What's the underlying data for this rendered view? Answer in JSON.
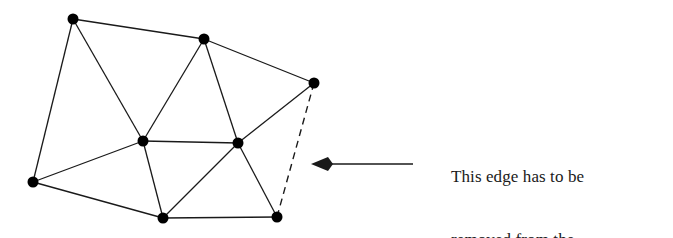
{
  "figure": {
    "background_color": "#ffffff",
    "stroke_color": "#1a1a1a",
    "vertex_color": "#000000",
    "vertex_radius": 5.5,
    "edge_width": 1.3,
    "dashed_edge_width": 1.4,
    "dash_pattern": "7 5"
  },
  "annotation": {
    "line1": "This edge has to be",
    "line2": "removed from the",
    "line3": "Delaunay triangulation."
  },
  "arrow": {
    "label": "pointer-to-dashed-edge",
    "direction": "left",
    "tail_x": 413,
    "tail_y": 164,
    "tip_x": 311,
    "tip_y": 164,
    "color": "#1a1a1a",
    "shaft_width": 1.6,
    "head_length": 17,
    "head_half_width": 7,
    "head_notch": 5
  },
  "graph": {
    "vertices": [
      {
        "id": "v0",
        "name": "top-left-vertex",
        "x": 73,
        "y": 19
      },
      {
        "id": "v1",
        "name": "top-middle-vertex",
        "x": 204,
        "y": 39
      },
      {
        "id": "v2",
        "name": "right-vertex",
        "x": 314,
        "y": 83
      },
      {
        "id": "v3",
        "name": "center-left-vertex",
        "x": 143,
        "y": 141
      },
      {
        "id": "v4",
        "name": "center-right-vertex",
        "x": 238,
        "y": 143
      },
      {
        "id": "v5",
        "name": "left-vertex",
        "x": 33,
        "y": 182
      },
      {
        "id": "v6",
        "name": "bottom-middle-vertex",
        "x": 163,
        "y": 218
      },
      {
        "id": "v7",
        "name": "bottom-right-vertex",
        "x": 277,
        "y": 217
      }
    ],
    "solid_edges": [
      {
        "name": "edge-top-left-to-top-middle",
        "from": "v0",
        "to": "v1"
      },
      {
        "name": "edge-top-middle-to-right",
        "from": "v1",
        "to": "v2"
      },
      {
        "name": "edge-top-left-to-left",
        "from": "v0",
        "to": "v5"
      },
      {
        "name": "edge-top-left-to-center-left",
        "from": "v0",
        "to": "v3"
      },
      {
        "name": "edge-top-middle-to-center-left",
        "from": "v1",
        "to": "v3"
      },
      {
        "name": "edge-top-middle-to-center-right",
        "from": "v1",
        "to": "v4"
      },
      {
        "name": "edge-right-to-center-right",
        "from": "v2",
        "to": "v4"
      },
      {
        "name": "edge-center-left-to-center-right",
        "from": "v3",
        "to": "v4"
      },
      {
        "name": "edge-left-to-center-left",
        "from": "v5",
        "to": "v3"
      },
      {
        "name": "edge-left-to-bottom-middle",
        "from": "v5",
        "to": "v6"
      },
      {
        "name": "edge-center-left-to-bottom-middle",
        "from": "v3",
        "to": "v6"
      },
      {
        "name": "edge-center-right-to-bottom-middle",
        "from": "v4",
        "to": "v6"
      },
      {
        "name": "edge-center-right-to-bottom-right",
        "from": "v4",
        "to": "v7"
      },
      {
        "name": "edge-bottom-middle-to-bottom-right",
        "from": "v6",
        "to": "v7"
      }
    ],
    "dashed_edges": [
      {
        "name": "edge-to-be-removed",
        "from": "v2",
        "to": "v7"
      }
    ]
  }
}
